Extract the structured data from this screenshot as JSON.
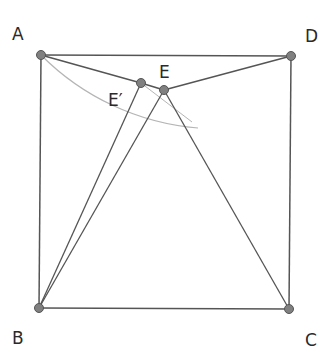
{
  "diagram": {
    "type": "geometry-square",
    "colors": {
      "line": "#555555",
      "arc": "#b5b5b5",
      "point_fill": "#808080",
      "point_stroke": "#555555",
      "label": "#2a2a2a"
    },
    "points": {
      "A": {
        "label": "A",
        "x": 41,
        "y": 55,
        "lx": 12,
        "ly": 40
      },
      "D": {
        "label": "D",
        "x": 291,
        "y": 56,
        "lx": 305,
        "ly": 42
      },
      "B": {
        "label": "B",
        "x": 39,
        "y": 308,
        "lx": 12,
        "ly": 344
      },
      "C": {
        "label": "C",
        "x": 289,
        "y": 309,
        "lx": 305,
        "ly": 346
      },
      "E": {
        "label": "E",
        "x": 164,
        "y": 90,
        "lx": 160,
        "ly": 78
      },
      "E_prime": {
        "label": "E′",
        "x": 141,
        "y": 83,
        "lx": 108,
        "ly": 106
      }
    },
    "segments": [
      [
        "A",
        "D"
      ],
      [
        "A",
        "B"
      ],
      [
        "B",
        "C"
      ],
      [
        "D",
        "C"
      ],
      [
        "A",
        "E_prime"
      ],
      [
        "E_prime",
        "E"
      ],
      [
        "E",
        "D"
      ],
      [
        "B",
        "E_prime"
      ],
      [
        "B",
        "E"
      ],
      [
        "E",
        "C"
      ]
    ],
    "arc_description": "Thin light arc centered at D through A, passing E', extending beyond E"
  }
}
